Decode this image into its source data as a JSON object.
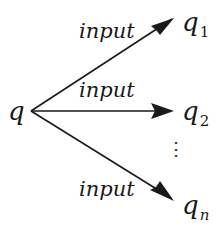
{
  "diagram": {
    "type": "state-transition-fanout",
    "source_node": {
      "label": "q"
    },
    "target_nodes": [
      {
        "base": "q",
        "subscript": "1"
      },
      {
        "base": "q",
        "subscript": "2"
      },
      {
        "base": "q",
        "subscript": "n"
      }
    ],
    "edges": [
      {
        "from": "q",
        "to": "q1",
        "label": "input"
      },
      {
        "from": "q",
        "to": "q2",
        "label": "input"
      },
      {
        "from": "q",
        "to": "qn",
        "label": "input"
      }
    ],
    "ellipsis": "⋮",
    "colors": {
      "stroke": "#1a1a1a",
      "background": "#ffffff"
    }
  }
}
